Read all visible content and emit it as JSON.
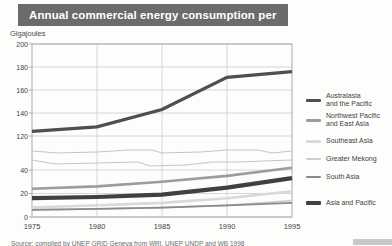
{
  "title": "Annual commercial energy consumption per capita",
  "y_axis_title": "Gigajoules",
  "source_note": "Source: compiled by UNEP GRID Geneva from WRI, UNEP UNDP and WB 1998",
  "colors": {
    "title_bar_bg": "#6b6b6b",
    "title_bar_text": "#ffffff",
    "grid": "#cccccc",
    "plot_border": "#aaaaaa",
    "axis_break_line": "#c4c4c4",
    "tick_text": "#3f3f3f"
  },
  "chart_data": {
    "type": "line",
    "title": "Annual commercial energy consumption per capita",
    "ylabel": "Gigajoules",
    "xlabel": "",
    "x": [
      1975,
      1980,
      1985,
      1990,
      1995
    ],
    "x_tick_labels": [
      "1975",
      "1980",
      "1985",
      "1990",
      "1995"
    ],
    "grid": true,
    "legend_position": "right",
    "axis_break": {
      "present": true,
      "upper_ticks": [
        200,
        180,
        160,
        140,
        120
      ],
      "lower_ticks": [
        40,
        20,
        0
      ],
      "upper_range": [
        120,
        200
      ],
      "lower_range": [
        0,
        40
      ]
    },
    "series": [
      {
        "name": "Australasia and the Pacific",
        "section": "upper",
        "values": [
          124,
          128,
          143,
          171,
          176
        ],
        "color": "#4f4f4f",
        "width": 3.2
      },
      {
        "name": "Northwest Pacific and East Asia",
        "section": "lower",
        "values": [
          24,
          26,
          30,
          35,
          42
        ],
        "color": "#9c9c9c",
        "width": 2.6
      },
      {
        "name": "Southeast Asia",
        "section": "lower",
        "values": [
          8,
          10,
          12,
          16,
          22
        ],
        "color": "#d9d9d9",
        "width": 2.6
      },
      {
        "name": "Greater Mekong",
        "section": "lower",
        "values": [
          6,
          7,
          8,
          10,
          14
        ],
        "color": "#cdcdcd",
        "width": 1.8
      },
      {
        "name": "South Asia",
        "section": "lower",
        "values": [
          6,
          7,
          8,
          10,
          12
        ],
        "color": "#8a8a8a",
        "width": 1.8
      },
      {
        "name": "Asia and Pacific",
        "section": "lower",
        "values": [
          16,
          17,
          19,
          25,
          33
        ],
        "color": "#404040",
        "width": 4.2
      }
    ]
  },
  "legend": {
    "items": [
      {
        "lines": [
          "Australasia",
          "and the Pacific"
        ]
      },
      {
        "lines": [
          "Northwest Pacific",
          "and  East Asia"
        ]
      },
      {
        "lines": [
          "Southeast Asia"
        ]
      },
      {
        "lines": [
          "Greater Mekong"
        ]
      },
      {
        "lines": [
          "South Asia"
        ]
      },
      {
        "lines": [
          "Asia and Pacific"
        ]
      }
    ]
  }
}
